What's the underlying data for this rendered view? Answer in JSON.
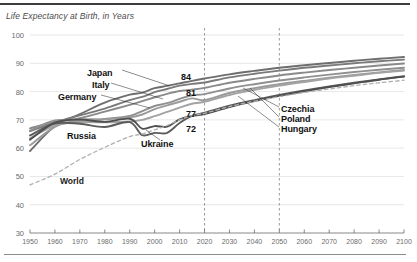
{
  "chart": {
    "title": "Life Expectancy at Birth, in Years",
    "top_rule": "divider-top",
    "bottom_rule": "divider-bottom"
  },
  "axis": {
    "y_ticks": [
      "100",
      "90",
      "80",
      "70",
      "60",
      "50",
      "40",
      "30"
    ],
    "x_ticks": [
      "1950",
      "1960",
      "1970",
      "1980",
      "1990",
      "2000",
      "2010",
      "2020",
      "2030",
      "2040",
      "2050",
      "2060",
      "2070",
      "2080",
      "2090",
      "2100"
    ]
  },
  "labels": {
    "japan": "Japan",
    "italy": "Italy",
    "germany": "Germany",
    "russia": "Russia",
    "ukraine": "Ukraine",
    "world": "World",
    "czechia": "Czechia",
    "poland": "Poland",
    "hungary": "Hungary"
  },
  "value_labels": {
    "v84": "84",
    "v81": "81",
    "v77": "77",
    "v72": "72"
  },
  "chart_data": {
    "type": "line",
    "title": "Life Expectancy at Birth, in Years",
    "xlabel": "",
    "ylabel": "",
    "xlim": [
      1950,
      2100
    ],
    "ylim": [
      30,
      100
    ],
    "grid": true,
    "legend": "inline-annotations",
    "x": [
      1950,
      1960,
      1970,
      1980,
      1990,
      1995,
      2000,
      2005,
      2010,
      2015,
      2020,
      2030,
      2040,
      2050,
      2060,
      2070,
      2080,
      2090,
      2100
    ],
    "series": [
      {
        "name": "Japan",
        "style": "solid",
        "color": "#6e6e6e",
        "label_value_2020": 84,
        "values": [
          59,
          67.8,
          72.0,
          76.1,
          78.9,
          79.6,
          81.2,
          82.0,
          82.9,
          83.8,
          84.6,
          86.1,
          87.3,
          88.4,
          89.3,
          90.1,
          90.9,
          91.6,
          92.2
        ]
      },
      {
        "name": "Italy",
        "style": "solid",
        "color": "#7a7a7a",
        "label_value_2020": 83,
        "values": [
          66.0,
          69.1,
          71.6,
          74.0,
          77.0,
          78.1,
          79.8,
          80.9,
          82.1,
          82.7,
          83.2,
          85.0,
          86.3,
          87.4,
          88.4,
          89.2,
          90.0,
          90.7,
          91.3
        ]
      },
      {
        "name": "Germany",
        "style": "solid",
        "color": "#8a8a8a",
        "label_value_2020": 81,
        "values": [
          67.0,
          69.3,
          70.6,
          72.9,
          75.3,
          76.6,
          78.0,
          79.2,
          80.2,
          80.7,
          81.3,
          83.1,
          84.5,
          85.7,
          86.7,
          87.6,
          88.4,
          89.2,
          89.9
        ]
      },
      {
        "name": "Czechia",
        "style": "solid",
        "color": "#909090",
        "label_value_2020": 79,
        "values": [
          66.2,
          69.8,
          69.5,
          70.3,
          71.4,
          73.1,
          74.9,
          75.9,
          77.4,
          78.7,
          79.1,
          81.1,
          82.6,
          83.9,
          85.0,
          86.0,
          86.9,
          87.7,
          88.4
        ]
      },
      {
        "name": "Poland",
        "style": "solid",
        "color": "#9a9a9a",
        "label_value_2020": 77,
        "values": [
          61.0,
          67.5,
          70.0,
          70.2,
          70.9,
          71.9,
          73.8,
          75.1,
          76.4,
          77.6,
          77.0,
          79.5,
          81.2,
          82.6,
          83.8,
          84.9,
          85.9,
          86.8,
          87.6
        ]
      },
      {
        "name": "Hungary",
        "style": "solid",
        "color": "#a3a3a3",
        "label_value_2020": 76,
        "values": [
          63.5,
          68.0,
          69.2,
          69.1,
          69.4,
          70.0,
          71.3,
          72.8,
          74.3,
          75.7,
          76.4,
          78.8,
          80.6,
          82.1,
          83.4,
          84.6,
          85.6,
          86.6,
          87.4
        ]
      },
      {
        "name": "Russia",
        "style": "solid",
        "color": "#5c5c5c",
        "label_value_2020": 77,
        "values": [
          64.5,
          68.7,
          68.6,
          67.5,
          69.2,
          64.6,
          65.4,
          65.4,
          68.9,
          71.4,
          72.5,
          75.0,
          77.0,
          78.8,
          80.4,
          81.8,
          83.1,
          84.3,
          85.4
        ]
      },
      {
        "name": "Ukraine",
        "style": "solid",
        "color": "#4f4f4f",
        "label_value_2020": 72,
        "values": [
          63.0,
          69.0,
          70.1,
          69.3,
          70.4,
          66.9,
          67.8,
          67.6,
          70.2,
          71.4,
          72.0,
          74.5,
          76.6,
          78.5,
          80.1,
          81.6,
          82.9,
          84.2,
          85.3
        ]
      },
      {
        "name": "World",
        "style": "dashed",
        "color": "#b0b0b0",
        "values": [
          47.0,
          50.8,
          56.0,
          60.3,
          64.1,
          65.0,
          66.5,
          68.0,
          70.0,
          71.5,
          72.3,
          74.7,
          76.6,
          78.2,
          79.7,
          80.9,
          82.1,
          83.1,
          84.0
        ]
      }
    ],
    "projection_markers": [
      2020,
      2050
    ],
    "annotations": [
      {
        "text": "84",
        "x": 2020,
        "y": 84
      },
      {
        "text": "81",
        "x": 2020,
        "y": 81
      },
      {
        "text": "77",
        "x": 2020,
        "y": 77
      },
      {
        "text": "72",
        "x": 2020,
        "y": 72
      }
    ]
  }
}
